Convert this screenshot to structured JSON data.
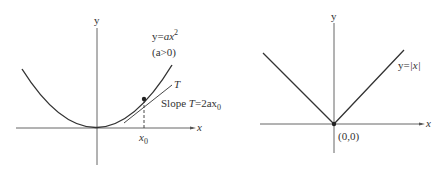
{
  "left_panel": {
    "y_axis_label": "y",
    "x_axis_label": "x",
    "curve_label_prefix": "y=",
    "curve_label_expr": "ax",
    "curve_label_exp": "2",
    "condition_label": "(a>0)",
    "tangent_label": "T",
    "slope_label_prefix": "Slope ",
    "slope_label_T": "T",
    "slope_label_eq": "=2ax",
    "slope_label_sub": "0",
    "x0_label": "x",
    "x0_sub": "0"
  },
  "right_panel": {
    "y_axis_label": "y",
    "x_axis_label": "x",
    "curve_label_prefix": "y=",
    "curve_label_expr": "|x|",
    "origin_label": "(0,0)"
  },
  "colors": {
    "stroke": "#333333",
    "axis": "#555555"
  }
}
